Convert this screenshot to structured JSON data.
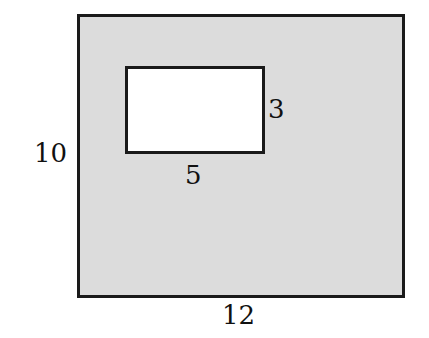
{
  "figure": {
    "colors": {
      "outer_fill": "#dcdcdc",
      "inner_fill": "#ffffff",
      "stroke": "#1a1a1a",
      "text": "#111111"
    },
    "outer_rectangle": {
      "width_label": "12",
      "height_label": "10"
    },
    "inner_rectangle": {
      "width_label": "5",
      "height_label": "3"
    }
  }
}
